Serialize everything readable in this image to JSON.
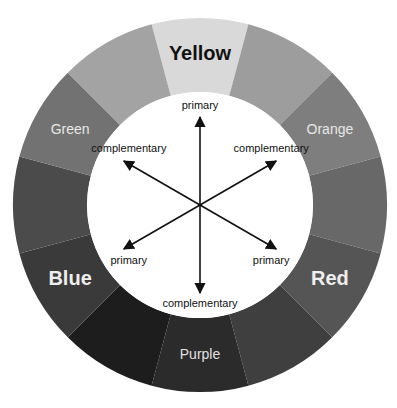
{
  "diagram": {
    "center": [
      200,
      205
    ],
    "outer_radius": 187,
    "inner_radius": 113,
    "segments": [
      {
        "name": "yellow",
        "label": "Yellow",
        "fill": "#d9d9d9",
        "label_color": "#111111",
        "label_size": 20,
        "bold": true
      },
      {
        "name": "yellow-orange",
        "label": "",
        "fill": "#9d9d9d"
      },
      {
        "name": "orange",
        "label": "Orange",
        "fill": "#7e7e7e",
        "label_color": "#e8e8e8",
        "label_size": 14,
        "bold": false
      },
      {
        "name": "red-orange",
        "label": "",
        "fill": "#686868"
      },
      {
        "name": "red",
        "label": "Red",
        "fill": "#555555",
        "label_color": "#eeeeee",
        "label_size": 20,
        "bold": true
      },
      {
        "name": "red-purple",
        "label": "",
        "fill": "#3f3f3f"
      },
      {
        "name": "purple",
        "label": "Purple",
        "fill": "#2b2b2b",
        "label_color": "#e0e0e0",
        "label_size": 14,
        "bold": false
      },
      {
        "name": "blue-purple",
        "label": "",
        "fill": "#1d1d1d"
      },
      {
        "name": "blue",
        "label": "Blue",
        "fill": "#3a3a3a",
        "label_color": "#eeeeee",
        "label_size": 20,
        "bold": true
      },
      {
        "name": "blue-green",
        "label": "",
        "fill": "#4b4b4b"
      },
      {
        "name": "green",
        "label": "Green",
        "fill": "#727272",
        "label_color": "#e8e8e8",
        "label_size": 14,
        "bold": false
      },
      {
        "name": "yellow-green",
        "label": "",
        "fill": "#a3a3a3"
      }
    ],
    "arrows": [
      {
        "angle": -90,
        "label": "primary"
      },
      {
        "angle": -30,
        "label": "complementary"
      },
      {
        "angle": 30,
        "label": "primary"
      },
      {
        "angle": 90,
        "label": "complementary"
      },
      {
        "angle": 150,
        "label": "primary"
      },
      {
        "angle": 210,
        "label": "complementary"
      }
    ],
    "arrow_color": "#111111"
  }
}
